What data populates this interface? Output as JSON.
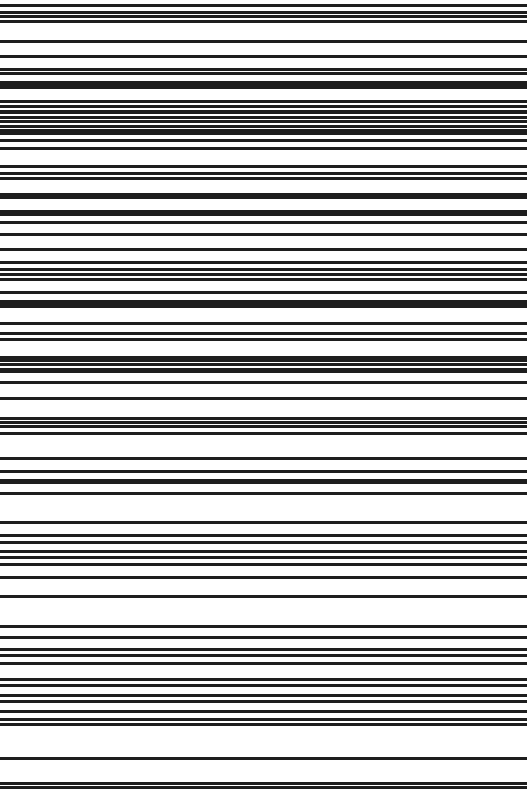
{
  "image": {
    "description": "Rotated barcode: horizontal black bars on white background",
    "width": 527,
    "height": 793,
    "background": "#ffffff",
    "bar_color": "#1e1e1e"
  },
  "bars": [
    {
      "y": 4,
      "h": 3
    },
    {
      "y": 11,
      "h": 3
    },
    {
      "y": 15,
      "h": 3
    },
    {
      "y": 20,
      "h": 3
    },
    {
      "y": 40,
      "h": 3
    },
    {
      "y": 55,
      "h": 3
    },
    {
      "y": 68,
      "h": 3
    },
    {
      "y": 72,
      "h": 3
    },
    {
      "y": 81,
      "h": 8
    },
    {
      "y": 100,
      "h": 3
    },
    {
      "y": 105,
      "h": 3
    },
    {
      "y": 110,
      "h": 4
    },
    {
      "y": 116,
      "h": 3
    },
    {
      "y": 120,
      "h": 3
    },
    {
      "y": 125,
      "h": 3
    },
    {
      "y": 129,
      "h": 6
    },
    {
      "y": 139,
      "h": 3
    },
    {
      "y": 147,
      "h": 3
    },
    {
      "y": 165,
      "h": 3
    },
    {
      "y": 172,
      "h": 3
    },
    {
      "y": 177,
      "h": 3
    },
    {
      "y": 193,
      "h": 6
    },
    {
      "y": 210,
      "h": 6
    },
    {
      "y": 221,
      "h": 3
    },
    {
      "y": 233,
      "h": 3
    },
    {
      "y": 248,
      "h": 3
    },
    {
      "y": 261,
      "h": 3
    },
    {
      "y": 268,
      "h": 3
    },
    {
      "y": 273,
      "h": 3
    },
    {
      "y": 278,
      "h": 3
    },
    {
      "y": 291,
      "h": 3
    },
    {
      "y": 300,
      "h": 5
    },
    {
      "y": 305,
      "h": 3
    },
    {
      "y": 322,
      "h": 3
    },
    {
      "y": 332,
      "h": 3
    },
    {
      "y": 338,
      "h": 3
    },
    {
      "y": 356,
      "h": 6
    },
    {
      "y": 363,
      "h": 3
    },
    {
      "y": 368,
      "h": 5
    },
    {
      "y": 381,
      "h": 3
    },
    {
      "y": 397,
      "h": 3
    },
    {
      "y": 417,
      "h": 3
    },
    {
      "y": 421,
      "h": 3
    },
    {
      "y": 425,
      "h": 3
    },
    {
      "y": 432,
      "h": 3
    },
    {
      "y": 457,
      "h": 3
    },
    {
      "y": 470,
      "h": 3
    },
    {
      "y": 479,
      "h": 5
    },
    {
      "y": 492,
      "h": 3
    },
    {
      "y": 521,
      "h": 3
    },
    {
      "y": 534,
      "h": 3
    },
    {
      "y": 541,
      "h": 3
    },
    {
      "y": 550,
      "h": 3
    },
    {
      "y": 556,
      "h": 3
    },
    {
      "y": 563,
      "h": 3
    },
    {
      "y": 576,
      "h": 3
    },
    {
      "y": 595,
      "h": 3
    },
    {
      "y": 625,
      "h": 3
    },
    {
      "y": 636,
      "h": 3
    },
    {
      "y": 648,
      "h": 3
    },
    {
      "y": 654,
      "h": 3
    },
    {
      "y": 662,
      "h": 3
    },
    {
      "y": 678,
      "h": 3
    },
    {
      "y": 684,
      "h": 3
    },
    {
      "y": 694,
      "h": 3
    },
    {
      "y": 700,
      "h": 3
    },
    {
      "y": 710,
      "h": 3
    },
    {
      "y": 718,
      "h": 3
    },
    {
      "y": 723,
      "h": 3
    },
    {
      "y": 757,
      "h": 3
    },
    {
      "y": 782,
      "h": 3
    },
    {
      "y": 786,
      "h": 3
    }
  ]
}
